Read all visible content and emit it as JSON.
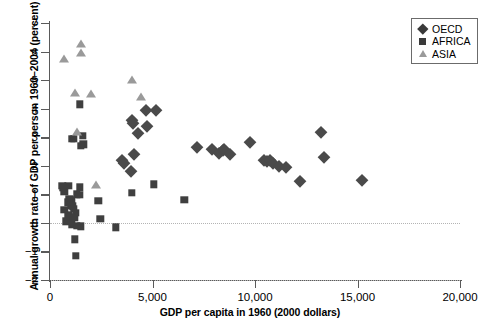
{
  "chart_data": {
    "type": "scatter",
    "title": "",
    "xlabel": "GDP per capita in 1960 (2000 dollars)",
    "ylabel": "Annual growth rate of GDP per person 1960–2004 (percent)",
    "xlim": [
      0,
      20000
    ],
    "ylim": [
      -2,
      7
    ],
    "xticks": [
      0,
      5000,
      10000,
      15000,
      20000
    ],
    "xtick_labels": [
      "0",
      "5,000",
      "10,000",
      "15,000",
      "20,000"
    ],
    "yticks": [
      -2,
      -1,
      0,
      1,
      2,
      3,
      4,
      5,
      6,
      7
    ],
    "ytick_labels": [
      "−2",
      "−1",
      "0",
      "1",
      "2",
      "3",
      "4",
      "5",
      "6",
      "7"
    ],
    "grid": "horizontal dotted at y=0 and y=-2",
    "legend_position": "top-right",
    "series": [
      {
        "name": "OECD",
        "marker": "diamond",
        "color": "#4a4a4a",
        "points": [
          [
            3950,
            1.8
          ],
          [
            4000,
            3.6
          ],
          [
            4030,
            3.5
          ],
          [
            4080,
            2.4
          ],
          [
            4700,
            3.95
          ],
          [
            5150,
            3.95
          ],
          [
            4750,
            3.4
          ],
          [
            4300,
            3.15
          ],
          [
            3500,
            2.2
          ],
          [
            3620,
            2.1
          ],
          [
            7150,
            2.65
          ],
          [
            7900,
            2.6
          ],
          [
            8250,
            2.45
          ],
          [
            8420,
            2.55
          ],
          [
            8500,
            2.6
          ],
          [
            8800,
            2.4
          ],
          [
            9750,
            2.85
          ],
          [
            10450,
            2.2
          ],
          [
            10600,
            2.15
          ],
          [
            10750,
            2.2
          ],
          [
            10900,
            2.1
          ],
          [
            11150,
            2.0
          ],
          [
            11500,
            1.95
          ],
          [
            12200,
            1.45
          ],
          [
            13200,
            3.2
          ],
          [
            13350,
            2.3
          ],
          [
            15200,
            1.5
          ]
        ]
      },
      {
        "name": "AFRICA",
        "marker": "square",
        "color": "#3f3f3f",
        "points": [
          [
            1450,
            4.15
          ],
          [
            1050,
            2.95
          ],
          [
            1150,
            2.95
          ],
          [
            1600,
            3.05
          ],
          [
            1620,
            2.75
          ],
          [
            1500,
            2.7
          ],
          [
            600,
            1.3
          ],
          [
            620,
            1.22
          ],
          [
            900,
            1.3
          ],
          [
            1450,
            1.25
          ],
          [
            700,
            1.08
          ],
          [
            1300,
            1.0
          ],
          [
            1450,
            0.98
          ],
          [
            950,
            0.85
          ],
          [
            1050,
            0.8
          ],
          [
            2350,
            0.78
          ],
          [
            900,
            0.72
          ],
          [
            1000,
            0.62
          ],
          [
            1100,
            0.58
          ],
          [
            700,
            0.45
          ],
          [
            1150,
            0.5
          ],
          [
            1250,
            0.35
          ],
          [
            900,
            0.28
          ],
          [
            1000,
            0.2
          ],
          [
            1200,
            0.18
          ],
          [
            2450,
            0.15
          ],
          [
            780,
            0.05
          ],
          [
            1050,
            -0.05
          ],
          [
            1300,
            -0.1
          ],
          [
            1500,
            -0.12
          ],
          [
            3200,
            -0.15
          ],
          [
            1200,
            -0.58
          ],
          [
            1250,
            -1.15
          ],
          [
            5050,
            1.35
          ],
          [
            4000,
            1.05
          ],
          [
            6550,
            0.8
          ]
        ]
      },
      {
        "name": "ASIA",
        "marker": "triangle",
        "color": "#9a9a9a",
        "points": [
          [
            700,
            5.75
          ],
          [
            1500,
            6.25
          ],
          [
            1500,
            5.95
          ],
          [
            1200,
            4.55
          ],
          [
            2000,
            4.52
          ],
          [
            4000,
            5.02
          ],
          [
            4450,
            4.4
          ],
          [
            1300,
            3.2
          ],
          [
            2250,
            1.32
          ]
        ]
      }
    ]
  },
  "legend": {
    "items": [
      {
        "label": "OECD",
        "symbol": "diamond-icon"
      },
      {
        "label": "AFRICA",
        "symbol": "square-icon"
      },
      {
        "label": "ASIA",
        "symbol": "triangle-icon"
      }
    ]
  }
}
